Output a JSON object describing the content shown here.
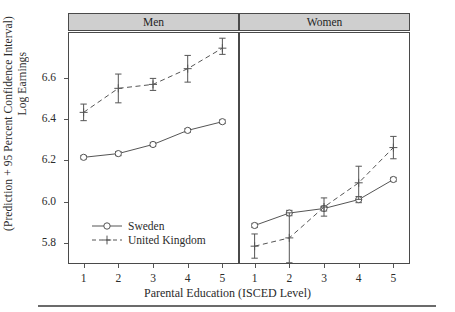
{
  "axes": {
    "ylabel_line1": "Log Earnings",
    "ylabel_line2": "(Prediction + 95 Percent Confidence Interval)",
    "xlabel": "Parental Education (ISCED Level)",
    "yticks": [
      "5.8",
      "6.0",
      "6.2",
      "6.4",
      "6.6"
    ],
    "xticks": [
      "1",
      "2",
      "3",
      "4",
      "5"
    ]
  },
  "panels": [
    {
      "title": "Men"
    },
    {
      "title": "Women"
    }
  ],
  "legend": {
    "entries": [
      {
        "label": "Sweden",
        "marker": "open-circle",
        "line": "solid"
      },
      {
        "label": "United Kingdom",
        "marker": "plus",
        "line": "dashed"
      }
    ]
  },
  "colors": {
    "strip_fill": "#cfcfcf",
    "frame": "#4a4a4a",
    "line": "#555555",
    "text": "#2b2b2b"
  },
  "chart_data": {
    "type": "line",
    "title": "",
    "xlabel": "Parental Education (ISCED Level)",
    "ylabel": "Log Earnings (Prediction + 95 Percent Confidence Interval)",
    "x": [
      1,
      2,
      3,
      4,
      5
    ],
    "xlim": [
      0.55,
      5.45
    ],
    "ylim": [
      5.7,
      6.82
    ],
    "ytick_values": [
      5.8,
      6.0,
      6.2,
      6.4,
      6.6
    ],
    "grid": false,
    "legend_position": "bottom-left-inside-men-panel",
    "facets": [
      {
        "name": "Men",
        "series": [
          {
            "name": "Sweden",
            "line": "solid",
            "marker": "open-circle",
            "values": [
              6.215,
              6.233,
              6.277,
              6.345,
              6.387
            ],
            "ci_low": [
              6.207,
              6.223,
              6.268,
              6.336,
              6.378
            ],
            "ci_high": [
              6.224,
              6.243,
              6.287,
              6.354,
              6.396
            ]
          },
          {
            "name": "United Kingdom",
            "line": "dashed",
            "marker": "plus",
            "values": [
              6.432,
              6.548,
              6.567,
              6.643,
              6.742
            ],
            "ci_low": [
              6.392,
              6.478,
              6.538,
              6.578,
              6.712
            ],
            "ci_high": [
              6.472,
              6.617,
              6.596,
              6.707,
              6.79
            ]
          }
        ]
      },
      {
        "name": "Women",
        "series": [
          {
            "name": "Sweden",
            "line": "solid",
            "marker": "open-circle",
            "values": [
              5.886,
              5.946,
              5.968,
              6.011,
              6.108
            ],
            "ci_low": [
              5.876,
              5.933,
              5.956,
              5.996,
              6.098
            ],
            "ci_high": [
              5.896,
              5.959,
              5.98,
              6.026,
              6.118
            ]
          },
          {
            "name": "United Kingdom",
            "line": "dashed",
            "marker": "plus",
            "values": [
              5.786,
              5.826,
              5.975,
              6.092,
              6.262
            ],
            "ci_low": [
              5.728,
              5.706,
              5.931,
              6.012,
              6.208
            ],
            "ci_high": [
              5.845,
              5.947,
              6.019,
              6.172,
              6.316
            ]
          }
        ]
      }
    ]
  }
}
